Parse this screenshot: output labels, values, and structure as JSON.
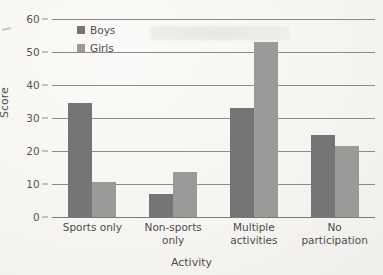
{
  "chart_data": {
    "type": "bar",
    "title": "",
    "xlabel": "Activity",
    "ylabel": "Score",
    "categories": [
      "Sports only",
      "Non-sports only",
      "Multiple activities",
      "No participation"
    ],
    "category_lines": [
      [
        "Sports only"
      ],
      [
        "Non-sports",
        "only"
      ],
      [
        "Multiple",
        "activities"
      ],
      [
        "No",
        "participation"
      ]
    ],
    "series": [
      {
        "name": "Boys",
        "color": "#767575",
        "values": [
          34.5,
          7,
          33,
          25
        ]
      },
      {
        "name": "Girls",
        "color": "#9b9a98",
        "values": [
          10.5,
          13.5,
          53,
          21.5
        ]
      }
    ],
    "ylim": [
      0,
      60
    ],
    "yticks": [
      0,
      10,
      20,
      30,
      40,
      50,
      60
    ],
    "ytick_labels": [
      "0",
      "10",
      "20",
      "30",
      "40",
      "50",
      "60"
    ],
    "grid": true,
    "legend_position": "top-left-inside"
  },
  "legend": {
    "entries": [
      {
        "label": "Boys"
      },
      {
        "label": "Girls"
      }
    ]
  },
  "axes": {
    "y_title": "Score",
    "x_title": "Activity"
  }
}
